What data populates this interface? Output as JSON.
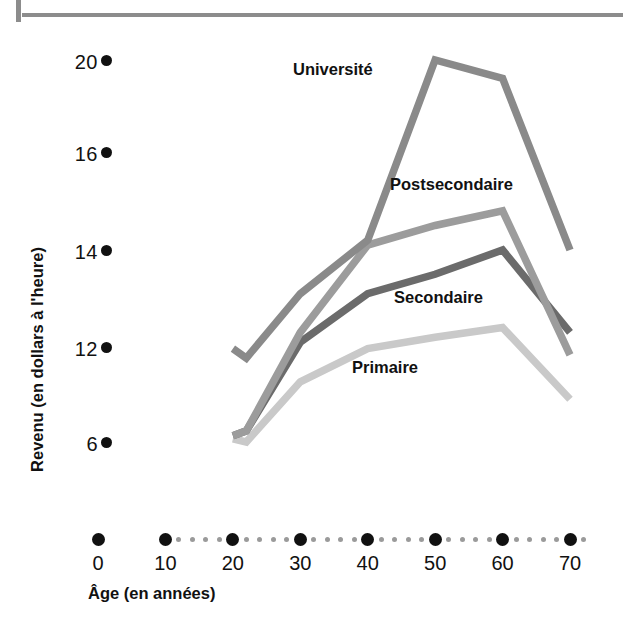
{
  "page": {
    "rule_present": true,
    "background_color": "#ffffff"
  },
  "chart_data": {
    "type": "line",
    "title": "",
    "xlabel": "Âge (en années)",
    "ylabel": "Revenu (en dollars à l'heure)",
    "x": [
      20,
      22,
      30,
      40,
      50,
      60,
      70
    ],
    "xlim": [
      0,
      72
    ],
    "ylim": [
      5,
      21
    ],
    "x_tick_labels": [
      "0",
      "10",
      "20",
      "30",
      "40",
      "50",
      "60",
      "70"
    ],
    "x_tick_values": [
      0,
      10,
      20,
      30,
      40,
      50,
      60,
      70
    ],
    "y_tick_labels": [
      "20",
      "16",
      "14",
      "12",
      "6"
    ],
    "y_tick_values": [
      20,
      16,
      14,
      12,
      6
    ],
    "grid": false,
    "legend_position": "inline-labels",
    "series": [
      {
        "name": "Université",
        "color": "#8a8a8a",
        "label_x": 293,
        "label_y": 60,
        "values": [
          11.9,
          11.3,
          13.1,
          14.2,
          20.0,
          19.2,
          14.0
        ]
      },
      {
        "name": "Postsecondaire",
        "color": "#9c9c9c",
        "label_x": 390,
        "label_y": 175,
        "values": [
          6.4,
          6.7,
          12.3,
          14.1,
          14.5,
          14.8,
          11.5
        ]
      },
      {
        "name": "Secondaire",
        "color": "#6b6b6b",
        "label_x": 394,
        "label_y": 288,
        "values": [
          6.4,
          6.7,
          12.1,
          13.1,
          13.5,
          14.0,
          12.3
        ]
      },
      {
        "name": "Primaire",
        "color": "#c9c9c9",
        "label_x": 352,
        "label_y": 358,
        "values": [
          6.2,
          6.0,
          9.8,
          11.9,
          12.2,
          12.4,
          8.7
        ]
      }
    ]
  },
  "axis_colors": {
    "tick_dot_major": "#111111",
    "tick_dot_minor": "#9a9a9a",
    "text": "#111111",
    "rule": "#8c8c8c"
  }
}
